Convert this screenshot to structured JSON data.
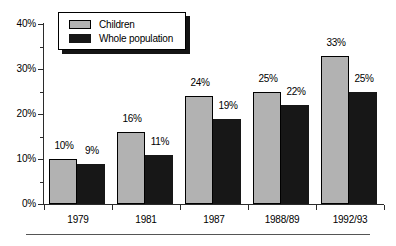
{
  "chart_data": {
    "type": "bar",
    "title": "",
    "subtitle": "",
    "xlabel": "",
    "ylabel": "",
    "ylim": [
      0,
      40
    ],
    "ytick_labels": [
      "0%",
      "10%",
      "20%",
      "30%",
      "40%"
    ],
    "ytick_values": [
      0,
      10,
      20,
      30,
      40
    ],
    "yminor_values": [
      5,
      15,
      25,
      35
    ],
    "grid": false,
    "legend_position": "top-left",
    "categories": [
      "1979",
      "1981",
      "1987",
      "1988/89",
      "1992/93"
    ],
    "series": [
      {
        "name": "Children",
        "color": "#b2b2b2",
        "values": [
          10,
          16,
          24,
          25,
          33
        ],
        "labels": [
          "10%",
          "16%",
          "24%",
          "25%",
          "33%"
        ]
      },
      {
        "name": "Whole population",
        "color": "#171717",
        "values": [
          9,
          11,
          19,
          22,
          25
        ],
        "labels": [
          "9%",
          "11%",
          "19%",
          "22%",
          "25%"
        ]
      }
    ]
  },
  "legend": {
    "items": [
      {
        "label": "Children",
        "swatch": "children"
      },
      {
        "label": "Whole population",
        "swatch": "whole"
      }
    ]
  }
}
